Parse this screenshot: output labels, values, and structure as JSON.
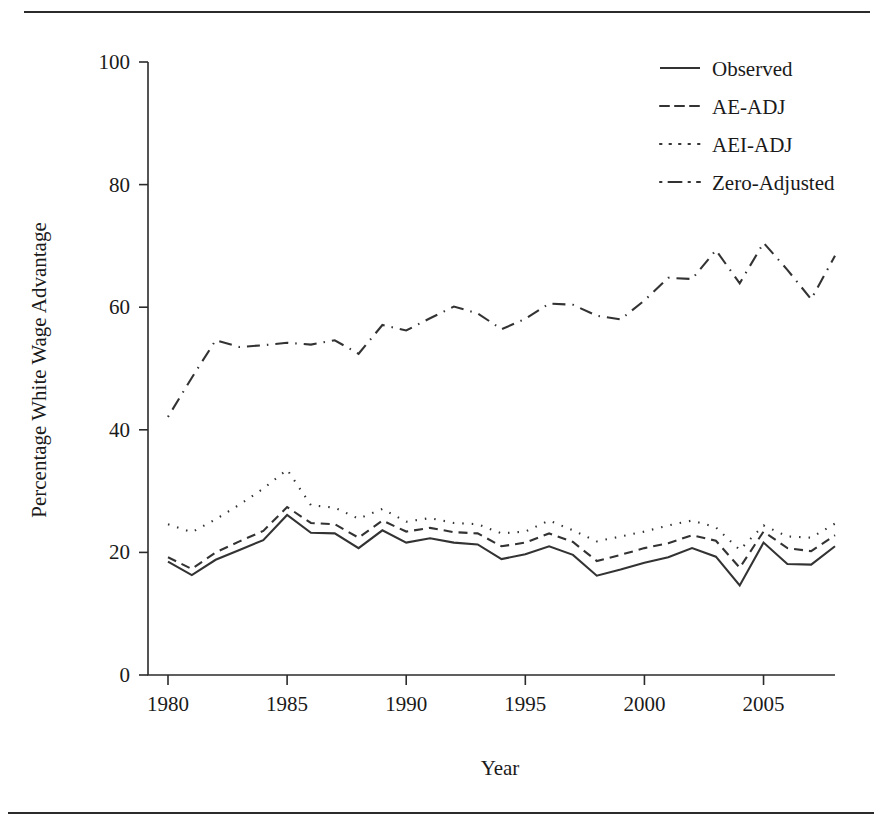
{
  "chart_data": {
    "type": "line",
    "title": "",
    "xlabel": "Year",
    "ylabel": "Percentage White Wage Advantage",
    "xlim": [
      1980,
      2008
    ],
    "ylim": [
      0,
      100
    ],
    "grid": false,
    "legend_position": "top-right",
    "x_ticks": [
      1980,
      1985,
      1990,
      1995,
      2000,
      2005
    ],
    "x_tick_labels": [
      "1980",
      "1985",
      "1990",
      "1995",
      "2000",
      "2005"
    ],
    "y_ticks": [
      0,
      20,
      40,
      60,
      80,
      100
    ],
    "y_tick_labels": [
      "0",
      "20",
      "40",
      "60",
      "80",
      "100"
    ],
    "x": [
      1980,
      1981,
      1982,
      1983,
      1984,
      1985,
      1986,
      1987,
      1988,
      1989,
      1990,
      1991,
      1992,
      1993,
      1994,
      1995,
      1996,
      1997,
      1998,
      1999,
      2000,
      2001,
      2002,
      2003,
      2004,
      2005,
      2006,
      2007,
      2008
    ],
    "series": [
      {
        "name": "Observed",
        "style": "solid",
        "values": [
          18.5,
          16.3,
          18.8,
          20.4,
          22.0,
          26.1,
          23.2,
          23.1,
          20.7,
          23.6,
          21.6,
          22.3,
          21.6,
          21.3,
          18.9,
          19.7,
          21.0,
          19.6,
          16.2,
          17.2,
          18.3,
          19.2,
          20.7,
          19.3,
          14.6,
          21.6,
          18.1,
          18.0,
          21.0
        ]
      },
      {
        "name": "AE-ADJ",
        "style": "dashed",
        "values": [
          19.2,
          17.3,
          20.0,
          21.8,
          23.5,
          27.4,
          24.8,
          24.6,
          22.4,
          25.2,
          23.4,
          24.0,
          23.3,
          23.1,
          21.0,
          21.6,
          23.1,
          21.7,
          18.6,
          19.6,
          20.7,
          21.5,
          22.8,
          21.9,
          17.5,
          23.4,
          20.7,
          20.2,
          22.8
        ]
      },
      {
        "name": "AEI-ADJ",
        "style": "dotted",
        "values": [
          24.6,
          23.3,
          25.4,
          27.8,
          30.4,
          33.5,
          27.7,
          27.3,
          25.5,
          27.1,
          25.0,
          25.6,
          24.8,
          24.6,
          23.1,
          23.4,
          25.2,
          23.6,
          21.8,
          22.6,
          23.4,
          24.4,
          25.2,
          24.1,
          20.4,
          24.4,
          22.6,
          22.4,
          24.7
        ]
      },
      {
        "name": "Zero-Adjusted",
        "style": "dashdot",
        "values": [
          42.1,
          48.5,
          54.6,
          53.5,
          53.8,
          54.2,
          53.9,
          54.6,
          52.4,
          57.1,
          56.2,
          58.2,
          60.1,
          59.0,
          56.4,
          58.1,
          60.6,
          60.4,
          58.6,
          58.0,
          61.1,
          64.8,
          64.6,
          69.3,
          63.9,
          70.5,
          66.1,
          61.3,
          68.4
        ]
      }
    ],
    "legend": [
      {
        "label": "Observed",
        "style": "solid"
      },
      {
        "label": "AE-ADJ",
        "style": "dashed"
      },
      {
        "label": "AEI-ADJ",
        "style": "dotted"
      },
      {
        "label": "Zero-Adjusted",
        "style": "dashdot"
      }
    ]
  },
  "geometry": {
    "x_axis_y": 675,
    "y_axis_x": 148,
    "x_min_px": 168,
    "x_max_px": 835,
    "y_zero_px": 675,
    "y_hundred_px": 62,
    "legend_x": 656,
    "legend_sample_x1": 660,
    "legend_sample_x2": 700,
    "legend_label_x": 712,
    "legend_y_start": 68,
    "legend_y_step": 38,
    "xlabel_x": 500,
    "xlabel_y": 775,
    "ylabel_x": 46,
    "ylabel_y": 370
  }
}
